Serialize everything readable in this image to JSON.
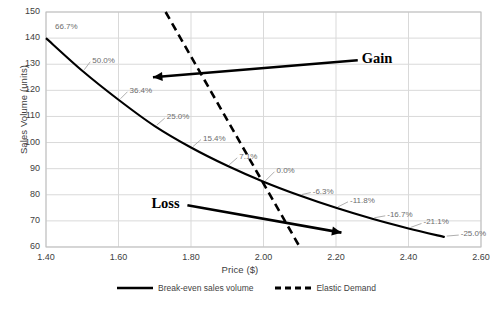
{
  "chart_data": {
    "type": "line",
    "title": "",
    "xlabel": "Price ($)",
    "ylabel": "Sales Volume (units)",
    "xlim": [
      1.4,
      2.6
    ],
    "ylim": [
      60,
      150
    ],
    "xticks": [
      "1.40",
      "1.60",
      "1.80",
      "2.00",
      "2.20",
      "2.40",
      "2.60"
    ],
    "yticks": [
      "150",
      "140",
      "130",
      "120",
      "110",
      "100",
      "90",
      "80",
      "70",
      "60"
    ],
    "grid": true,
    "legend_position": "bottom",
    "series": [
      {
        "name": "Break-even sales volume",
        "style": "solid",
        "color": "#000000",
        "x": [
          1.4,
          1.5,
          1.6,
          1.7,
          1.8,
          1.9,
          2.0,
          2.1,
          2.2,
          2.3,
          2.4,
          2.5
        ],
        "y": [
          140.0,
          127.5,
          116.4,
          106.3,
          98.1,
          91.1,
          85.0,
          79.7,
          75.0,
          70.8,
          67.1,
          63.8
        ],
        "point_labels": [
          "66.7%",
          "50.0%",
          "36.4%",
          "25.0%",
          "15.4%",
          "7.1%",
          "0.0%",
          "-6.3%",
          "-11.8%",
          "-16.7%",
          "-21.1%",
          "-25.0%"
        ]
      },
      {
        "name": "Elastic Demand",
        "style": "dashed",
        "color": "#000000",
        "x": [
          1.73,
          2.1
        ],
        "y": [
          150,
          60
        ]
      }
    ],
    "annotations": [
      {
        "text": "Gain",
        "x": 2.26,
        "y": 131.5,
        "arrow_to_x": 1.695,
        "arrow_to_y": 125.0
      },
      {
        "text": "Loss",
        "x": 1.79,
        "y": 76.0,
        "arrow_to_x": 2.215,
        "arrow_to_y": 65.5
      }
    ]
  },
  "legend": {
    "items": [
      {
        "label": "Break-even sales volume"
      },
      {
        "label": "Elastic Demand"
      }
    ]
  },
  "colors": {
    "line": "#000000",
    "grid": "#d9d9d9",
    "axis": "#bfbfbf",
    "label_text": "#6d6d6d",
    "tick_text": "#404040"
  }
}
